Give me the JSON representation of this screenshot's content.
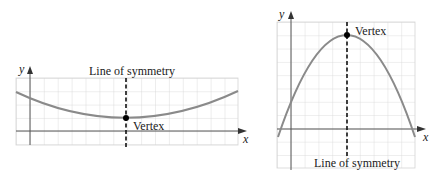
{
  "graphs": [
    {
      "id": "upward-parabola",
      "y_axis_label": "y",
      "x_axis_label": "x",
      "symmetry_label": "Line of symmetry",
      "vertex_label": "Vertex",
      "opens": "up"
    },
    {
      "id": "downward-parabola",
      "y_axis_label": "y",
      "x_axis_label": "x",
      "symmetry_label": "Line of symmetry",
      "vertex_label": "Vertex",
      "opens": "down"
    }
  ],
  "colors": {
    "grid": "#d4d4d4",
    "axis": "#555555",
    "curve": "#8a8a8a",
    "symmetry_line": "#111111",
    "vertex": "#000000"
  }
}
